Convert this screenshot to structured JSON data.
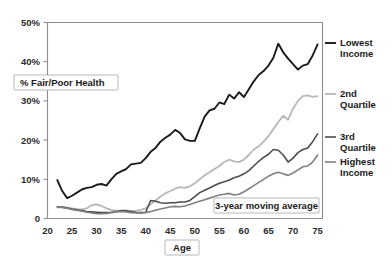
{
  "chart_data": {
    "type": "line",
    "title": "",
    "xlabel": "Age",
    "ylabel": "% Fair/Poor Health",
    "xlim": [
      20,
      76
    ],
    "ylim": [
      0,
      50
    ],
    "grid": false,
    "legend_position": "right",
    "annotation": "3-year moving average",
    "xticks": [
      20,
      25,
      30,
      35,
      40,
      45,
      50,
      55,
      60,
      65,
      70,
      75
    ],
    "xticklabels": [
      "20",
      "25",
      "30",
      "35",
      "40",
      "45",
      "50",
      "55",
      "60",
      "65",
      "70",
      "75"
    ],
    "yticks": [
      0,
      10,
      20,
      30,
      40,
      50
    ],
    "yticklabels": [
      "0",
      "10%",
      "20%",
      "30%",
      "40%",
      "50%"
    ],
    "x": [
      22,
      23,
      24,
      25,
      26,
      27,
      28,
      29,
      30,
      31,
      32,
      33,
      34,
      35,
      36,
      37,
      38,
      39,
      40,
      41,
      42,
      43,
      44,
      45,
      46,
      47,
      48,
      49,
      50,
      51,
      52,
      53,
      54,
      55,
      56,
      57,
      58,
      59,
      60,
      61,
      62,
      63,
      64,
      65,
      66,
      67,
      68,
      69,
      70,
      71,
      72,
      73,
      74,
      75
    ],
    "series": [
      {
        "name": "Lowest Income",
        "color": "#1a1a1a",
        "width": 1.9,
        "legend_label": "Lowest\nIncome",
        "values": [
          9.8,
          7.0,
          5.2,
          5.8,
          6.6,
          7.4,
          7.8,
          8.0,
          8.6,
          8.8,
          8.4,
          10.0,
          11.4,
          12.0,
          12.6,
          13.8,
          14.0,
          14.2,
          15.4,
          17.0,
          18.0,
          19.6,
          20.6,
          21.4,
          22.6,
          21.8,
          20.2,
          19.8,
          19.8,
          23.0,
          26.0,
          27.6,
          28.0,
          29.6,
          29.2,
          31.6,
          30.6,
          32.2,
          31.0,
          33.0,
          35.0,
          36.6,
          37.6,
          39.0,
          41.0,
          44.6,
          42.4,
          40.8,
          39.4,
          38.0,
          39.0,
          39.4,
          41.6,
          44.4
        ]
      },
      {
        "name": "2nd Quartile",
        "color": "#b8b8b8",
        "width": 1.8,
        "legend_label": "2nd\nQuartile",
        "values": [
          2.8,
          2.9,
          2.8,
          2.6,
          2.4,
          2.3,
          2.6,
          3.4,
          3.6,
          3.2,
          2.6,
          2.2,
          2.0,
          1.8,
          1.8,
          1.9,
          2.0,
          2.2,
          2.6,
          3.6,
          4.6,
          5.6,
          6.4,
          7.0,
          7.6,
          8.0,
          7.8,
          8.2,
          9.0,
          10.0,
          11.0,
          11.8,
          12.6,
          13.4,
          14.4,
          15.0,
          14.6,
          14.4,
          15.0,
          16.2,
          17.6,
          18.4,
          19.6,
          21.0,
          22.8,
          24.6,
          26.2,
          25.2,
          28.0,
          30.0,
          31.2,
          31.4,
          31.0,
          31.2
        ]
      },
      {
        "name": "3rd Quartile",
        "color": "#4d4d4d",
        "width": 1.6,
        "legend_label": "3rd\nQuartile",
        "values": [
          3.0,
          2.9,
          2.7,
          2.4,
          2.2,
          2.0,
          1.8,
          1.7,
          1.6,
          1.5,
          1.5,
          1.6,
          1.8,
          2.0,
          2.0,
          1.8,
          1.6,
          1.5,
          1.6,
          4.6,
          4.4,
          4.0,
          3.9,
          4.0,
          4.0,
          4.2,
          4.2,
          4.6,
          5.6,
          6.6,
          7.2,
          7.8,
          8.4,
          9.0,
          9.4,
          9.8,
          10.4,
          10.8,
          11.4,
          12.2,
          13.4,
          14.6,
          15.6,
          16.4,
          17.6,
          17.4,
          16.2,
          14.4,
          15.4,
          16.8,
          17.6,
          18.0,
          19.6,
          21.6
        ]
      },
      {
        "name": "Highest Income",
        "color": "#808080",
        "width": 1.6,
        "legend_label": "Highest\nIncome",
        "values": [
          3.0,
          2.8,
          2.6,
          2.3,
          2.1,
          1.9,
          1.6,
          1.4,
          1.2,
          1.2,
          1.3,
          1.5,
          1.7,
          1.8,
          1.7,
          1.5,
          1.4,
          1.4,
          1.5,
          1.8,
          2.1,
          2.4,
          2.7,
          3.0,
          3.1,
          3.0,
          3.2,
          3.6,
          4.0,
          4.4,
          4.8,
          5.2,
          5.6,
          6.0,
          6.2,
          6.4,
          6.0,
          6.2,
          6.8,
          7.6,
          8.4,
          9.2,
          10.0,
          10.8,
          11.4,
          11.8,
          11.4,
          11.0,
          11.6,
          12.4,
          13.2,
          13.4,
          14.4,
          16.2
        ]
      }
    ]
  },
  "legend": {
    "items": [
      {
        "line1": "Lowest",
        "line2": "Income"
      },
      {
        "line1": "2nd",
        "line2": "Quartile"
      },
      {
        "line1": "3rd",
        "line2": "Quartile"
      },
      {
        "line1": "Highest",
        "line2": "Income"
      }
    ]
  },
  "labels": {
    "ylabel": "% Fair/Poor Health",
    "xlabel": "Age",
    "annotation": "3-year moving average"
  }
}
